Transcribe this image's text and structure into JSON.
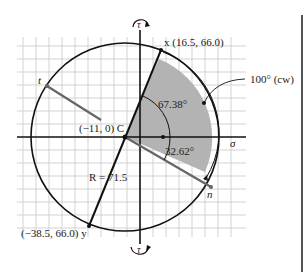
{
  "axes": {
    "sigma_label": "σ",
    "tau_top_label": "τ",
    "tau_bottom_label": "τ"
  },
  "center": {
    "label": "(−11, 0) C",
    "coords": [
      -11,
      0
    ]
  },
  "radius_label": "R = 71.5",
  "points": {
    "x": {
      "label": "x (16.5, 66.0)",
      "coords": [
        16.5,
        66.0
      ]
    },
    "y": {
      "label": "(−38.5, 66.0) y",
      "coords": [
        -38.5,
        66.0
      ]
    },
    "n": {
      "label": "n"
    },
    "t": {
      "label": "t"
    }
  },
  "angles": {
    "upper": "67.38°",
    "lower": "32.62°",
    "rotation": "100° (cw)"
  },
  "colors": {
    "shade": "#b3b3b3",
    "grid": "#c8c8c8",
    "line": "#111111",
    "gray_line": "#666666"
  }
}
